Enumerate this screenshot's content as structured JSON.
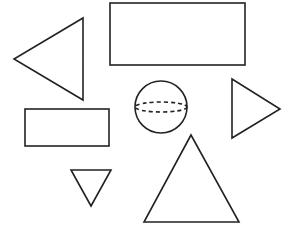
{
  "diagram": {
    "background": "#ffffff",
    "stroke_color": "#222222",
    "stroke_width": 1.6,
    "shapes": [
      {
        "id": "triangle-left",
        "type": "triangle",
        "orientation": "pointing-left",
        "points": "83,18 83,100 14,59"
      },
      {
        "id": "rectangle-top",
        "type": "rectangle",
        "x": 110,
        "y": 3,
        "width": 135,
        "height": 62
      },
      {
        "id": "sphere",
        "type": "sphere",
        "cx": 161,
        "cy": 107,
        "r": 26,
        "equator_ry": 5
      },
      {
        "id": "triangle-right",
        "type": "triangle",
        "orientation": "pointing-right",
        "points": "232,79 232,138 280,109"
      },
      {
        "id": "rectangle-small",
        "type": "rectangle",
        "x": 25,
        "y": 109,
        "width": 84,
        "height": 37
      },
      {
        "id": "triangle-inverted",
        "type": "triangle",
        "orientation": "pointing-down",
        "points": "71,170 111,170 91,206"
      },
      {
        "id": "triangle-large",
        "type": "triangle",
        "orientation": "pointing-up",
        "points": "191,135 144,222 239,222"
      }
    ]
  }
}
